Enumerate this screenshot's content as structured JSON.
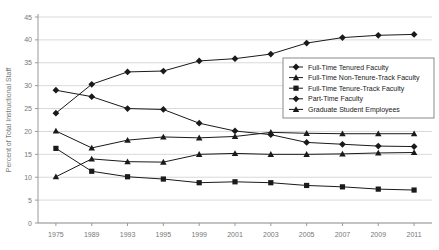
{
  "chart_data": {
    "type": "line",
    "title": "",
    "xlabel": "",
    "ylabel": "Percent of Total Instructional Staff",
    "categories": [
      "1975",
      "1989",
      "1993",
      "1995",
      "1999",
      "2001",
      "2003",
      "2005",
      "2007",
      "2009",
      "2011"
    ],
    "ylim": [
      0,
      45
    ],
    "ytick_step": 5,
    "yticks": [
      "0",
      "5",
      "10",
      "15",
      "20",
      "25",
      "30",
      "35",
      "40",
      "45"
    ],
    "grid": true,
    "legend_position": "center-right",
    "series": [
      {
        "name": "Full-Time Tenured Faculty",
        "marker": "diamond",
        "color": "#1a1a1a",
        "values": [
          29.0,
          27.6,
          25.0,
          24.8,
          21.8,
          20.1,
          19.3,
          17.6,
          17.2,
          16.8,
          16.7
        ]
      },
      {
        "name": "Full-Time Non-Tenure-Track Faculty",
        "marker": "triangle",
        "color": "#1a1a1a",
        "values": [
          10.1,
          14.0,
          13.4,
          13.3,
          15.0,
          15.2,
          15.0,
          15.0,
          15.1,
          15.3,
          15.4
        ]
      },
      {
        "name": "Full-Time Tenure-Track Faculty",
        "marker": "square",
        "color": "#1a1a1a",
        "values": [
          16.3,
          11.3,
          10.1,
          9.6,
          8.8,
          9.0,
          8.8,
          8.2,
          7.9,
          7.4,
          7.2
        ]
      },
      {
        "name": "Part-Time Faculty",
        "marker": "diamond",
        "color": "#1a1a1a",
        "values": [
          24.0,
          30.3,
          33.0,
          33.2,
          35.4,
          35.9,
          36.9,
          39.3,
          40.5,
          41.0,
          41.2
        ]
      },
      {
        "name": "Graduate Student Employees",
        "marker": "triangle",
        "color": "#1a1a1a",
        "values": [
          20.1,
          16.4,
          18.1,
          18.8,
          18.6,
          18.9,
          19.8,
          19.6,
          19.5,
          19.5,
          19.5
        ]
      }
    ]
  },
  "legend": {
    "items": [
      {
        "label": "Full-Time Tenured Faculty"
      },
      {
        "label": "Full-Time Non-Tenure-Track Faculty"
      },
      {
        "label": "Full-Time Tenure-Track Faculty"
      },
      {
        "label": "Part-Time Faculty"
      },
      {
        "label": "Graduate Student Employees"
      }
    ]
  }
}
